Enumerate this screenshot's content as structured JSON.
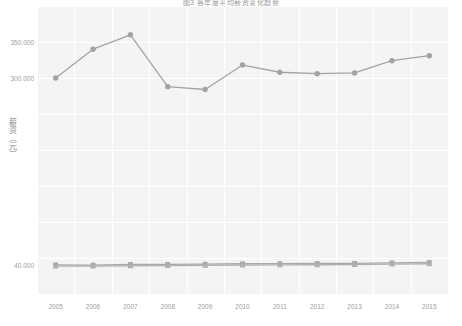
{
  "chart_data": {
    "type": "line",
    "title": "图3  各年度平均薪资变化趋势",
    "xlabel": "",
    "ylabel": "薪资（元）",
    "categories": [
      "2005",
      "2006",
      "2007",
      "2008",
      "2009",
      "2010",
      "2011",
      "2012",
      "2013",
      "2014",
      "2015"
    ],
    "x_tick_labels": [
      "2005",
      "2006",
      "2007",
      "2008",
      "2009",
      "2010",
      "2011",
      "2012",
      "2013",
      "2014",
      "2015"
    ],
    "y_tick_labels": [
      "350.000",
      "300.000",
      "40.000"
    ],
    "y_tick_values": [
      350000,
      300000,
      40000
    ],
    "ylim": [
      0,
      400000
    ],
    "grid": true,
    "legend": "none",
    "series": [
      {
        "name": "series-1",
        "marker": "circle",
        "color": "#a3a3a3",
        "values": [
          300000,
          340000,
          360000,
          288000,
          284000,
          318000,
          308000,
          306000,
          307000,
          324000,
          331000
        ]
      },
      {
        "name": "series-2",
        "marker": "square",
        "color": "#a8a8a8",
        "values": [
          40500,
          40200,
          41000,
          41200,
          41500,
          42000,
          42200,
          42400,
          42600,
          43200,
          43800
        ]
      },
      {
        "name": "series-3",
        "marker": "triangle",
        "color": "#b0b0b0",
        "values": [
          38800,
          38600,
          39200,
          39400,
          39700,
          40200,
          40400,
          40600,
          40800,
          41400,
          42000
        ]
      }
    ]
  },
  "colors": {
    "plot_background": "#f4f4f4",
    "gridline": "#ffffff",
    "tick_text": "#a0a0a0",
    "axis_title": "#8d8d8d"
  }
}
